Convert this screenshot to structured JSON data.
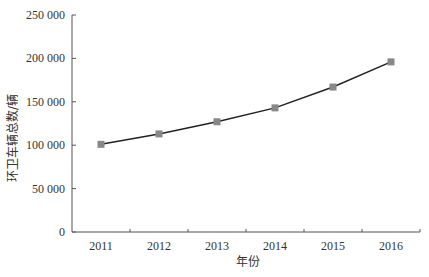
{
  "chart_data": {
    "type": "line",
    "title": "",
    "xlabel": "年份",
    "ylabel": "环卫车辆总数/辆",
    "categories": [
      "2011",
      "2012",
      "2013",
      "2014",
      "2015",
      "2016"
    ],
    "series": [
      {
        "name": "环卫车辆总数",
        "values": [
          101000,
          113000,
          127000,
          143000,
          167000,
          196000
        ],
        "color": "#222222",
        "marker": "square",
        "marker_color": "#888888"
      }
    ],
    "ylim": [
      0,
      250000
    ],
    "yticks": [
      0,
      50000,
      100000,
      150000,
      200000,
      250000
    ],
    "ytick_labels": [
      "0",
      "50 000",
      "100 000",
      "150 000",
      "200 000",
      "250 000"
    ],
    "grid": false,
    "legend": "none"
  }
}
